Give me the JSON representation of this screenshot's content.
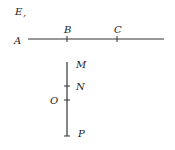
{
  "diagram": {
    "labels": {
      "E": "E",
      "E_dot": ",",
      "A": "A",
      "B": "B",
      "C": "C",
      "M": "M",
      "N": "N",
      "O": "O",
      "P": "P"
    },
    "horizontal_segment": {
      "from": "A",
      "points": [
        "B",
        "C"
      ]
    },
    "vertical_segment": {
      "top": "M",
      "points": [
        "N",
        "O"
      ],
      "bottom": "P"
    },
    "colors": {
      "line": "#333333",
      "text": "#222222",
      "background": "#ffffff"
    }
  }
}
